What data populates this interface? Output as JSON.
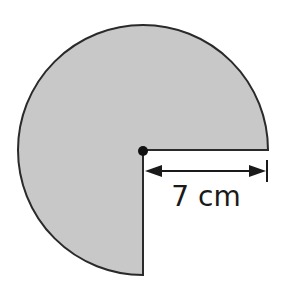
{
  "diagram": {
    "shape": "three-quarter circle (sector, 270 degrees)",
    "fill_color": "#c8c8c8",
    "stroke_color": "#2a2a2a",
    "radius_label": "7 cm",
    "center_point": "center-dot-icon"
  }
}
